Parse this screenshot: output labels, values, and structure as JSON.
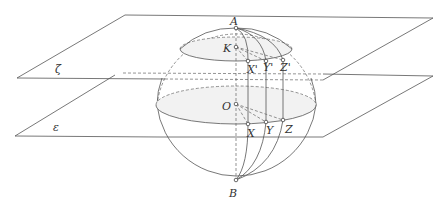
{
  "diagram": {
    "planes": [
      {
        "name": "zeta",
        "label": "ζ"
      },
      {
        "name": "epsilon",
        "label": "ε"
      }
    ],
    "points": {
      "A": "A",
      "B": "B",
      "O": "O",
      "K": "K",
      "X": "X",
      "Y": "Y",
      "Z": "Z",
      "Xp": "X'",
      "Yp": "Y'",
      "Zp": "Z'"
    }
  }
}
